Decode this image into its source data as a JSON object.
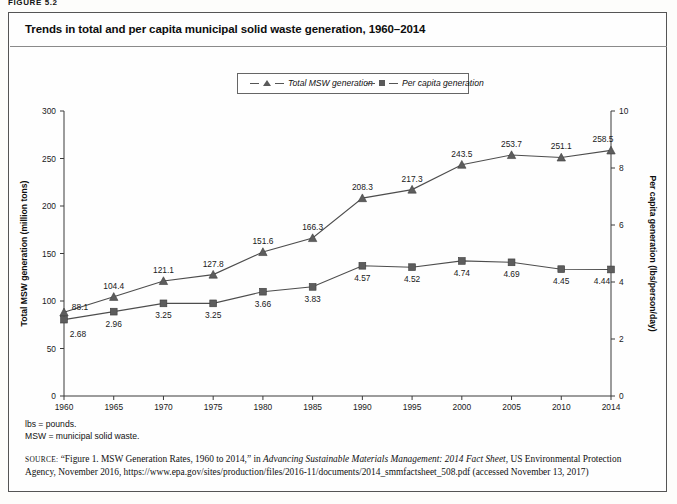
{
  "figure": {
    "label": "FIGURE 5.2",
    "title": "Trends in total and per capita municipal solid waste generation, 1960–2014"
  },
  "legend": {
    "position": "top-center",
    "items": [
      {
        "label": "Total MSW generation",
        "marker": "triangle-marker"
      },
      {
        "label": "Per capita generation",
        "marker": "square-marker"
      }
    ]
  },
  "notes": {
    "line1": "lbs = pounds.",
    "line2": "MSW = municipal solid waste."
  },
  "source": {
    "keyword": "SOURCE:",
    "part1": "“Figure 1. MSW Generation Rates, 1960 to 2014,” in ",
    "italic1": "Advancing Sustainable Materials Management: 2014 Fact Sheet",
    "part2": ", US Environmental Protection Agency, November 2016, https://www.epa.gov/sites/production/files/2016-11/documents/2014_smmfactsheet_508.pdf (accessed November 13, 2017)"
  },
  "chart_data": {
    "type": "line",
    "title": "Trends in total and per capita municipal solid waste generation, 1960–2014",
    "xlabel": "",
    "grid": false,
    "legend_position": "top-center",
    "categories": [
      "1960",
      "1965",
      "1970",
      "1975",
      "1980",
      "1985",
      "1990",
      "1995",
      "2000",
      "2005",
      "2010",
      "2014"
    ],
    "x": [
      1960,
      1965,
      1970,
      1975,
      1980,
      1985,
      1990,
      1995,
      2000,
      2005,
      2010,
      2014
    ],
    "xlim": [
      1960,
      2014
    ],
    "xticks": [
      "1960",
      "1965",
      "1970",
      "1975",
      "1980",
      "1985",
      "1990",
      "1995",
      "2000",
      "2005",
      "2010",
      "2014"
    ],
    "axes": [
      {
        "side": "left",
        "ylabel": "Total MSW generation (million tons)",
        "ylim": [
          0,
          300
        ],
        "yticks": [
          0,
          50,
          100,
          150,
          200,
          250,
          300
        ]
      },
      {
        "side": "right",
        "ylabel": "Per capita generation (lbs/person/day)",
        "ylim": [
          0,
          10
        ],
        "yticks": [
          0,
          2,
          4,
          6,
          8,
          10
        ]
      }
    ],
    "series": [
      {
        "name": "Total MSW generation",
        "axis": "left",
        "marker": "triangle",
        "units": "million tons",
        "values": [
          88.1,
          104.4,
          121.1,
          127.8,
          151.6,
          166.3,
          208.3,
          217.3,
          243.5,
          253.7,
          251.1,
          258.5
        ],
        "labels": [
          "88.1",
          "104.4",
          "121.1",
          "127.8",
          "151.6",
          "166.3",
          "208.3",
          "217.3",
          "243.5",
          "253.7",
          "251.1",
          "258.5"
        ]
      },
      {
        "name": "Per capita generation",
        "axis": "right",
        "marker": "square",
        "units": "lbs/person/day",
        "values": [
          2.68,
          2.96,
          3.25,
          3.25,
          3.66,
          3.83,
          4.57,
          4.52,
          4.74,
          4.69,
          4.45,
          4.44
        ],
        "labels": [
          "2.68",
          "2.96",
          "3.25",
          "3.25",
          "3.66",
          "3.83",
          "4.57",
          "4.52",
          "4.74",
          "4.69",
          "4.45",
          "4.44"
        ]
      }
    ],
    "colors": {
      "line": "#4d4d4d",
      "marker": "#5d5d5d",
      "axis": "#3a3a3a"
    }
  }
}
